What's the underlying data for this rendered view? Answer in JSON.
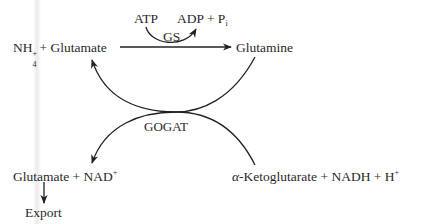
{
  "diagram": {
    "type": "biochemical-pathway",
    "nodes": {
      "ammonium_glutamate": {
        "nh": "NH",
        "sub": "4",
        "sup": "+",
        "rest": "+ Glutamate"
      },
      "glutamine": {
        "label": "Glutamine"
      },
      "glutamate_nad": {
        "label": "Glutamate + NAD",
        "sup": "+"
      },
      "ketoglutarate": {
        "alpha": "α",
        "label": "-Ketoglutarate + NADH + H",
        "sup": "+"
      },
      "export": {
        "label": "Export"
      }
    },
    "cofactors": {
      "atp": "ATP",
      "adp_pi": {
        "label": "ADP + P",
        "sub": "i"
      }
    },
    "enzymes": {
      "gs": "GS",
      "gogat": "GOGAT"
    },
    "edges": [
      {
        "from": "ammonium_glutamate",
        "to": "glutamine",
        "enzyme": "GS",
        "consumes": "ATP",
        "produces": "ADP + Pi"
      },
      {
        "from": "glutamine",
        "to": "ammonium_glutamate",
        "enzyme": "GOGAT",
        "via": "crossing-curve"
      },
      {
        "from": "ketoglutarate",
        "to": "glutamate_nad",
        "enzyme": "GOGAT",
        "via": "crossing-curve"
      },
      {
        "from": "glutamate_nad",
        "to": "export"
      }
    ],
    "colors": {
      "line": "#222222",
      "text": "#2a2a2a",
      "background": "#ffffff"
    }
  }
}
